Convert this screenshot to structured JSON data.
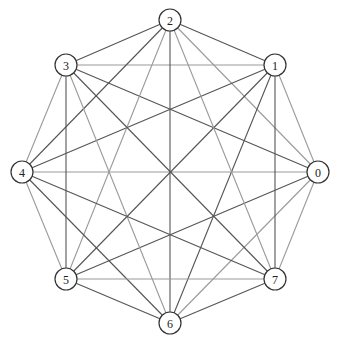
{
  "diagram": {
    "type": "complete-graph",
    "name": "K8",
    "node_radius": 11,
    "colors": {
      "background": "#ffffff",
      "node_stroke": "#333333",
      "edge_dark": "#555555",
      "edge_light": "#9a9a9a"
    },
    "nodes": [
      {
        "id": "0",
        "label": "0",
        "x": 318,
        "y": 172
      },
      {
        "id": "1",
        "label": "1",
        "x": 275,
        "y": 65
      },
      {
        "id": "2",
        "label": "2",
        "x": 170,
        "y": 20
      },
      {
        "id": "3",
        "label": "3",
        "x": 66,
        "y": 65
      },
      {
        "id": "4",
        "label": "4",
        "x": 22,
        "y": 172
      },
      {
        "id": "5",
        "label": "5",
        "x": 66,
        "y": 279
      },
      {
        "id": "6",
        "label": "6",
        "x": 170,
        "y": 323
      },
      {
        "id": "7",
        "label": "7",
        "x": 275,
        "y": 279
      }
    ],
    "edges": [
      [
        "0",
        "1",
        "light"
      ],
      [
        "0",
        "2",
        "light"
      ],
      [
        "0",
        "3",
        "dark"
      ],
      [
        "0",
        "4",
        "light"
      ],
      [
        "0",
        "5",
        "dark"
      ],
      [
        "0",
        "6",
        "light"
      ],
      [
        "0",
        "7",
        "light"
      ],
      [
        "1",
        "2",
        "dark"
      ],
      [
        "1",
        "3",
        "light"
      ],
      [
        "1",
        "4",
        "dark"
      ],
      [
        "1",
        "5",
        "dark"
      ],
      [
        "1",
        "6",
        "dark"
      ],
      [
        "1",
        "7",
        "dark"
      ],
      [
        "2",
        "3",
        "dark"
      ],
      [
        "2",
        "4",
        "dark"
      ],
      [
        "2",
        "5",
        "light"
      ],
      [
        "2",
        "6",
        "dark"
      ],
      [
        "2",
        "7",
        "light"
      ],
      [
        "3",
        "4",
        "light"
      ],
      [
        "3",
        "5",
        "dark"
      ],
      [
        "3",
        "6",
        "light"
      ],
      [
        "3",
        "7",
        "dark"
      ],
      [
        "4",
        "5",
        "light"
      ],
      [
        "4",
        "6",
        "dark"
      ],
      [
        "4",
        "7",
        "dark"
      ],
      [
        "5",
        "6",
        "dark"
      ],
      [
        "5",
        "7",
        "light"
      ],
      [
        "6",
        "7",
        "dark"
      ]
    ]
  }
}
